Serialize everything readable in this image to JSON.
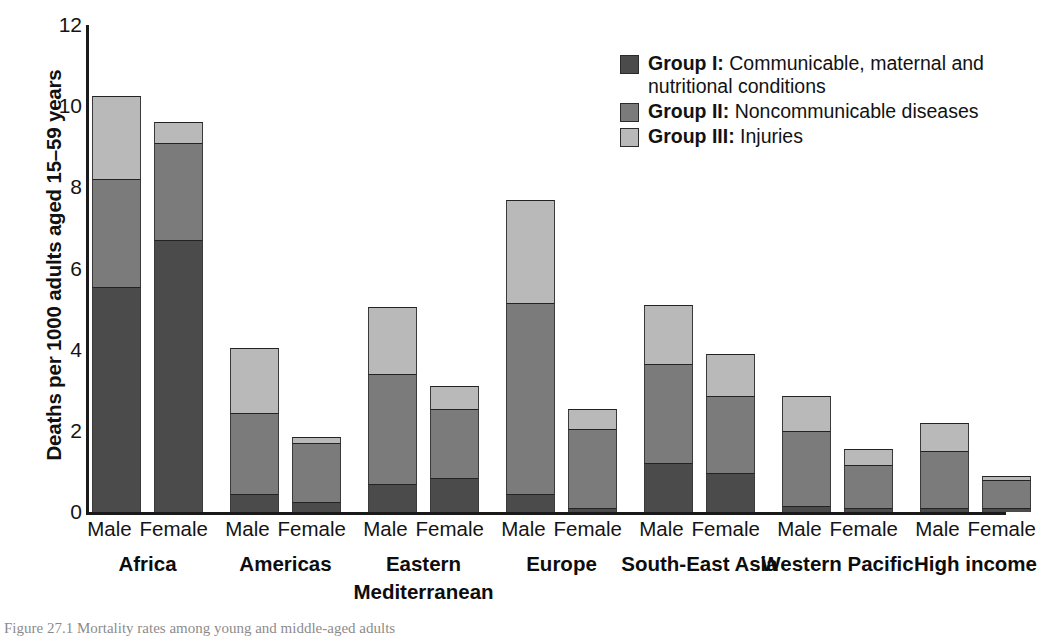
{
  "figure": {
    "caption": "Figure 27.1  Mortality rates among young and middle-aged adults",
    "y_axis_title": "Deaths per 1000 adults aged 15–59 years"
  },
  "legend": {
    "position": "top-right",
    "items": [
      {
        "key": "Group I:",
        "label": "Communicable, maternal and nutritional conditions",
        "swatch": "dark-gray",
        "color": "#4b4b4b"
      },
      {
        "key": "Group II:",
        "label": "Noncommunicable diseases",
        "swatch": "medium-gray",
        "color": "#7b7b7b"
      },
      {
        "key": "Group III:",
        "label": "Injuries",
        "swatch": "light-gray",
        "color": "#b9b9b9"
      }
    ]
  },
  "chart_data": {
    "type": "bar",
    "subtype": "stacked",
    "title": "",
    "xlabel": "",
    "ylabel": "Deaths per 1000 adults aged 15–59 years",
    "ylim": [
      0,
      12
    ],
    "yticks": [
      0,
      2,
      4,
      6,
      8,
      10,
      12
    ],
    "grid": false,
    "legend_position": "top-right",
    "categories": [
      "Africa Male",
      "Africa Female",
      "Americas Male",
      "Americas Female",
      "Eastern Mediterranean Male",
      "Eastern Mediterranean Female",
      "Europe Male",
      "Europe Female",
      "South-East Asia Male",
      "South-East Asia Female",
      "Western Pacific Male",
      "Western Pacific Female",
      "High income Male",
      "High income Female"
    ],
    "groups": [
      {
        "region": "Africa",
        "sexes": [
          "Male",
          "Female"
        ]
      },
      {
        "region": "Americas",
        "sexes": [
          "Male",
          "Female"
        ]
      },
      {
        "region": "Eastern Mediterranean",
        "sexes": [
          "Male",
          "Female"
        ]
      },
      {
        "region": "Europe",
        "sexes": [
          "Male",
          "Female"
        ]
      },
      {
        "region": "South-East Asia",
        "sexes": [
          "Male",
          "Female"
        ]
      },
      {
        "region": "Western Pacific",
        "sexes": [
          "Male",
          "Female"
        ]
      },
      {
        "region": "High income",
        "sexes": [
          "Male",
          "Female"
        ]
      }
    ],
    "series": [
      {
        "name": "Group I: Communicable, maternal and nutritional conditions",
        "color": "#4b4b4b",
        "values": [
          5.55,
          6.7,
          0.45,
          0.25,
          0.7,
          0.85,
          0.45,
          0.1,
          1.2,
          0.95,
          0.15,
          0.1,
          0.1,
          0.1
        ]
      },
      {
        "name": "Group II: Noncommunicable diseases",
        "color": "#7b7b7b",
        "values": [
          2.65,
          2.4,
          2.0,
          1.45,
          2.7,
          1.7,
          4.7,
          1.95,
          2.45,
          1.9,
          1.85,
          1.05,
          1.4,
          0.7
        ]
      },
      {
        "name": "Group III: Injuries",
        "color": "#b9b9b9",
        "values": [
          2.05,
          0.5,
          1.6,
          0.15,
          1.65,
          0.55,
          2.55,
          0.5,
          1.45,
          1.05,
          0.85,
          0.4,
          0.7,
          0.1
        ]
      }
    ],
    "totals": [
      10.25,
      9.6,
      4.05,
      1.85,
      5.05,
      3.1,
      7.7,
      2.55,
      5.1,
      3.9,
      2.85,
      1.55,
      2.2,
      0.9
    ]
  }
}
